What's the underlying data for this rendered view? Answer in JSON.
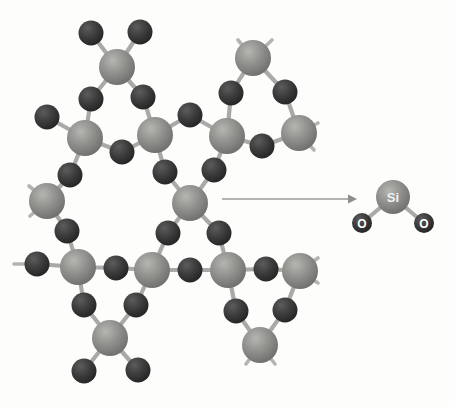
{
  "figure": {
    "background_color": "#fdfdfc",
    "bond_color": "#a9a9a7",
    "si_color": "#8a8a88",
    "o_color": "#3a3a3a",
    "arrow_color": "#9a9a9a"
  },
  "labels": {
    "si": "Si",
    "o_left": "O",
    "o_right": "O"
  },
  "legend": {
    "si_atom_name": "silicon-atom",
    "o_atom_name": "oxygen-atom",
    "arrow_name": "reaction-arrow"
  },
  "network": {
    "silicon_atoms": [
      {
        "id": "si1",
        "x": 117,
        "y": 67
      },
      {
        "id": "si2",
        "x": 85,
        "y": 138
      },
      {
        "id": "si3",
        "x": 155,
        "y": 135
      },
      {
        "id": "si4",
        "x": 253,
        "y": 58
      },
      {
        "id": "si5",
        "x": 227,
        "y": 136
      },
      {
        "id": "si6",
        "x": 299,
        "y": 133
      },
      {
        "id": "si7",
        "x": 47,
        "y": 201
      },
      {
        "id": "si8",
        "x": 190,
        "y": 203
      },
      {
        "id": "si9",
        "x": 78,
        "y": 267
      },
      {
        "id": "si10",
        "x": 152,
        "y": 270
      },
      {
        "id": "si11",
        "x": 228,
        "y": 270
      },
      {
        "id": "si12",
        "x": 300,
        "y": 271
      },
      {
        "id": "si13",
        "x": 110,
        "y": 338
      },
      {
        "id": "si14",
        "x": 260,
        "y": 345
      }
    ],
    "oxygen_atoms": [
      {
        "id": "o1",
        "x": 91,
        "y": 33
      },
      {
        "id": "o2",
        "x": 140,
        "y": 32
      },
      {
        "id": "o3",
        "x": 91,
        "y": 99
      },
      {
        "id": "o4",
        "x": 143,
        "y": 97
      },
      {
        "id": "o5",
        "x": 47,
        "y": 117
      },
      {
        "id": "o6",
        "x": 122,
        "y": 152
      },
      {
        "id": "o7",
        "x": 70,
        "y": 175
      },
      {
        "id": "o8",
        "x": 190,
        "y": 115
      },
      {
        "id": "o9",
        "x": 231,
        "y": 93
      },
      {
        "id": "o10",
        "x": 285,
        "y": 92
      },
      {
        "id": "o11",
        "x": 262,
        "y": 146
      },
      {
        "id": "o12",
        "x": 165,
        "y": 172
      },
      {
        "id": "o13",
        "x": 214,
        "y": 170
      },
      {
        "id": "o14",
        "x": 67,
        "y": 231
      },
      {
        "id": "o15",
        "x": 37,
        "y": 264
      },
      {
        "id": "o16",
        "x": 116,
        "y": 268
      },
      {
        "id": "o17",
        "x": 168,
        "y": 233
      },
      {
        "id": "o18",
        "x": 219,
        "y": 233
      },
      {
        "id": "o19",
        "x": 190,
        "y": 270
      },
      {
        "id": "o20",
        "x": 266,
        "y": 269
      },
      {
        "id": "o21",
        "x": 84,
        "y": 305
      },
      {
        "id": "o22",
        "x": 136,
        "y": 305
      },
      {
        "id": "o23",
        "x": 236,
        "y": 311
      },
      {
        "id": "o24",
        "x": 285,
        "y": 310
      },
      {
        "id": "o25",
        "x": 84,
        "y": 371
      },
      {
        "id": "o26",
        "x": 138,
        "y": 370
      }
    ],
    "bonds": [
      [
        "si1",
        "o1"
      ],
      [
        "si1",
        "o2"
      ],
      [
        "si1",
        "o3"
      ],
      [
        "si1",
        "o4"
      ],
      [
        "si2",
        "o3"
      ],
      [
        "si2",
        "o5"
      ],
      [
        "si2",
        "o6"
      ],
      [
        "si2",
        "o7"
      ],
      [
        "si3",
        "o4"
      ],
      [
        "si3",
        "o6"
      ],
      [
        "si3",
        "o8"
      ],
      [
        "si3",
        "o12"
      ],
      [
        "si4",
        "o9"
      ],
      [
        "si4",
        "o10"
      ],
      [
        "si5",
        "o8"
      ],
      [
        "si5",
        "o9"
      ],
      [
        "si5",
        "o11"
      ],
      [
        "si5",
        "o13"
      ],
      [
        "si6",
        "o10"
      ],
      [
        "si6",
        "o11"
      ],
      [
        "si7",
        "o7"
      ],
      [
        "si7",
        "o14"
      ],
      [
        "si8",
        "o12"
      ],
      [
        "si8",
        "o13"
      ],
      [
        "si8",
        "o17"
      ],
      [
        "si8",
        "o18"
      ],
      [
        "si9",
        "o14"
      ],
      [
        "si9",
        "o15"
      ],
      [
        "si9",
        "o16"
      ],
      [
        "si9",
        "o21"
      ],
      [
        "si10",
        "o16"
      ],
      [
        "si10",
        "o17"
      ],
      [
        "si10",
        "o19"
      ],
      [
        "si10",
        "o22"
      ],
      [
        "si11",
        "o18"
      ],
      [
        "si11",
        "o19"
      ],
      [
        "si11",
        "o20"
      ],
      [
        "si11",
        "o23"
      ],
      [
        "si12",
        "o20"
      ],
      [
        "si12",
        "o24"
      ],
      [
        "si13",
        "o21"
      ],
      [
        "si13",
        "o22"
      ],
      [
        "si13",
        "o25"
      ],
      [
        "si13",
        "o26"
      ],
      [
        "si14",
        "o23"
      ],
      [
        "si14",
        "o24"
      ]
    ],
    "open_stubs": [
      {
        "x1": 253,
        "y1": 58,
        "x2": 238,
        "y2": 40
      },
      {
        "x1": 253,
        "y1": 58,
        "x2": 272,
        "y2": 40
      },
      {
        "x1": 299,
        "y1": 133,
        "x2": 318,
        "y2": 123
      },
      {
        "x1": 299,
        "y1": 133,
        "x2": 314,
        "y2": 150
      },
      {
        "x1": 47,
        "y1": 201,
        "x2": 29,
        "y2": 186
      },
      {
        "x1": 47,
        "y1": 201,
        "x2": 30,
        "y2": 216
      },
      {
        "x1": 37,
        "y1": 264,
        "x2": 14,
        "y2": 264
      },
      {
        "x1": 300,
        "y1": 271,
        "x2": 318,
        "y2": 258
      },
      {
        "x1": 300,
        "y1": 271,
        "x2": 318,
        "y2": 283
      },
      {
        "x1": 260,
        "y1": 345,
        "x2": 246,
        "y2": 364
      },
      {
        "x1": 260,
        "y1": 345,
        "x2": 275,
        "y2": 364
      }
    ]
  },
  "product": {
    "si": {
      "x": 393,
      "y": 197,
      "r": 17
    },
    "o_left": {
      "x": 362,
      "y": 223,
      "r": 10
    },
    "o_right": {
      "x": 424,
      "y": 223,
      "r": 10
    }
  },
  "arrow": {
    "x1": 222,
    "y1": 199,
    "x2": 357,
    "y2": 199
  }
}
